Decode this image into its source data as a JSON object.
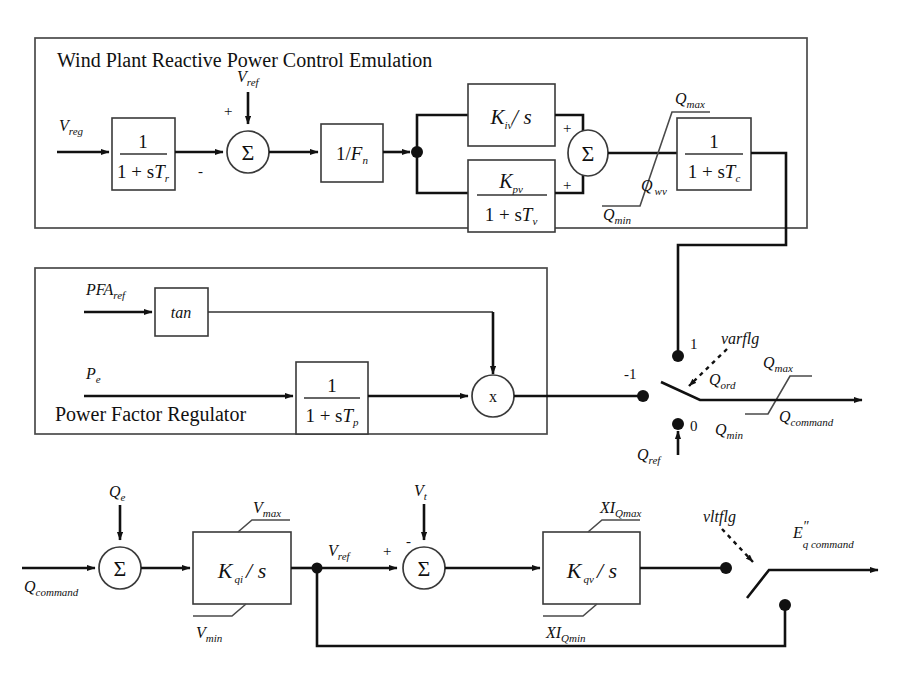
{
  "diagram": {
    "title": "Wind Plant Reactive Power Control Emulation",
    "groups": [
      {
        "id": "wind-plant",
        "label": "Wind Plant Reactive Power Control Emulation"
      },
      {
        "id": "power-factor",
        "label": "Power Factor Regulator"
      }
    ],
    "blocks": {
      "tr": {
        "num": "1",
        "den_pre": "1 + s",
        "den_sym": "T",
        "den_sub": "r"
      },
      "fn": {
        "text": "1/",
        "sym": "F",
        "sub": "n"
      },
      "kiv": {
        "sym": "K",
        "sub": "iv",
        "op": "/ s"
      },
      "kpv": {
        "num_sym": "K",
        "num_sub": "pv",
        "den_pre": "1 + s",
        "den_sym": "T",
        "den_sub": "v"
      },
      "tc": {
        "num": "1",
        "den_pre": "1 + s",
        "den_sym": "T",
        "den_sub": "c"
      },
      "tan": {
        "label": "tan"
      },
      "tp": {
        "num": "1",
        "den_pre": "1 + s",
        "den_sym": "T",
        "den_sub": "p"
      },
      "kqi": {
        "sym": "K",
        "sub": "qi",
        "op": "/ s"
      },
      "kqv": {
        "sym": "K",
        "sub": "qv",
        "op": "/ s"
      },
      "mult": {
        "label": "x"
      },
      "sum": {
        "label": "Σ"
      }
    },
    "signals": {
      "v_reg": {
        "sym": "V",
        "sub": "reg"
      },
      "v_ref_top": {
        "sym": "V",
        "sub": "ref"
      },
      "q_max_top": {
        "sym": "Q",
        "sub": "max"
      },
      "q_min_top": {
        "sym": "Q",
        "sub": "min"
      },
      "q_wv": {
        "sym": "Q",
        "sub": "wv"
      },
      "pfa_ref": {
        "sym": "PFA",
        "sub": "ref"
      },
      "p_e": {
        "sym": "P",
        "sub": "e"
      },
      "q_ref": {
        "sym": "Q",
        "sub": "ref"
      },
      "q_ord": {
        "sym": "Q",
        "sub": "ord"
      },
      "q_max_sw": {
        "sym": "Q",
        "sub": "max"
      },
      "q_min_sw": {
        "sym": "Q",
        "sub": "min"
      },
      "q_command_out": {
        "sym": "Q",
        "sub": "command"
      },
      "q_command_in": {
        "sym": "Q",
        "sub": "command"
      },
      "q_e": {
        "sym": "Q",
        "sub": "e"
      },
      "v_max": {
        "sym": "V",
        "sub": "max"
      },
      "v_min": {
        "sym": "V",
        "sub": "min"
      },
      "v_ref_bot": {
        "sym": "V",
        "sub": "ref"
      },
      "v_t": {
        "sym": "V",
        "sub": "t"
      },
      "xi_qmax": {
        "sym": "XI",
        "sub": "Qmax"
      },
      "xi_qmin": {
        "sym": "XI",
        "sub": "Qmin"
      },
      "eq_command": {
        "sym": "E",
        "sup": "″",
        "sub": "q command"
      }
    },
    "flags": {
      "varflg": {
        "label": "varflg",
        "pos_1": "1",
        "pos_0": "0",
        "pos_neg1": "-1"
      },
      "vltflg": {
        "label": "vltflg"
      }
    },
    "signs": {
      "sum1_top": "+",
      "sum1_left": "-",
      "sum2_kiv": "+",
      "sum2_kpv": "+",
      "sum_bot_left": "+",
      "sum_bot_top": "-"
    },
    "colors": {
      "line": "#111111",
      "box": "#3a3a3a",
      "background": "#ffffff"
    }
  }
}
